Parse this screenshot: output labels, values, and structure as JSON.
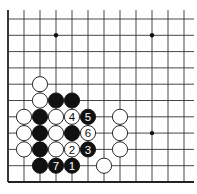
{
  "diagram": {
    "type": "go-board-partial",
    "view": "lower-left corner",
    "grid": {
      "origin_x": 8,
      "origin_y": 182,
      "col_spacing": 16,
      "row_spacing": 16.3,
      "cols_visible": 12,
      "rows_visible": 11,
      "line_color": "#333333",
      "edge_color": "#222222"
    },
    "star_points": [
      {
        "col": 3,
        "row": 9
      },
      {
        "col": 9,
        "row": 9
      },
      {
        "col": 9,
        "row": 3
      }
    ],
    "stones": [
      {
        "color": "white",
        "col": 2,
        "row": 6,
        "label": ""
      },
      {
        "color": "white",
        "col": 2,
        "row": 5,
        "label": ""
      },
      {
        "color": "black",
        "col": 3,
        "row": 5,
        "label": ""
      },
      {
        "color": "black",
        "col": 4,
        "row": 5,
        "label": ""
      },
      {
        "color": "white",
        "col": 1,
        "row": 4,
        "label": ""
      },
      {
        "color": "black",
        "col": 2,
        "row": 4,
        "label": ""
      },
      {
        "color": "white",
        "col": 3,
        "row": 4,
        "label": ""
      },
      {
        "color": "white",
        "col": 4,
        "row": 4,
        "label": "4"
      },
      {
        "color": "black",
        "col": 5,
        "row": 4,
        "label": "5"
      },
      {
        "color": "white",
        "col": 7,
        "row": 4,
        "label": ""
      },
      {
        "color": "white",
        "col": 1,
        "row": 3,
        "label": ""
      },
      {
        "color": "black",
        "col": 2,
        "row": 3,
        "label": ""
      },
      {
        "color": "white",
        "col": 3,
        "row": 3,
        "label": ""
      },
      {
        "color": "black",
        "col": 4,
        "row": 3,
        "label": ""
      },
      {
        "color": "white",
        "col": 5,
        "row": 3,
        "label": "6"
      },
      {
        "color": "white",
        "col": 7,
        "row": 3,
        "label": ""
      },
      {
        "color": "white",
        "col": 1,
        "row": 2,
        "label": ""
      },
      {
        "color": "black",
        "col": 2,
        "row": 2,
        "label": ""
      },
      {
        "color": "white",
        "col": 3,
        "row": 2,
        "label": ""
      },
      {
        "color": "white",
        "col": 4,
        "row": 2,
        "label": "2"
      },
      {
        "color": "black",
        "col": 5,
        "row": 2,
        "label": "3"
      },
      {
        "color": "white",
        "col": 7,
        "row": 2,
        "label": ""
      },
      {
        "color": "black",
        "col": 2,
        "row": 1,
        "label": ""
      },
      {
        "color": "black",
        "col": 3,
        "row": 1,
        "label": "7"
      },
      {
        "color": "black",
        "col": 4,
        "row": 1,
        "label": "1"
      },
      {
        "color": "white",
        "col": 6,
        "row": 1,
        "label": ""
      }
    ]
  }
}
